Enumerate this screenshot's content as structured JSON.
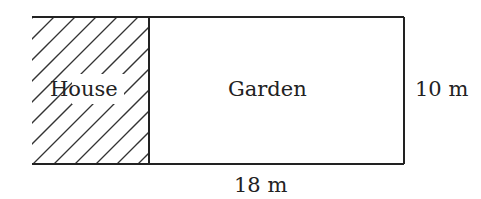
{
  "diagram": {
    "regions": [
      {
        "id": "house",
        "label": "House",
        "pattern": "hatched"
      },
      {
        "id": "garden",
        "label": "Garden",
        "pattern": "plain"
      }
    ],
    "dimensions": {
      "height_label": "10 m",
      "width_label": "18 m"
    },
    "colors": {
      "stroke": "#222222",
      "background": "#ffffff"
    }
  }
}
